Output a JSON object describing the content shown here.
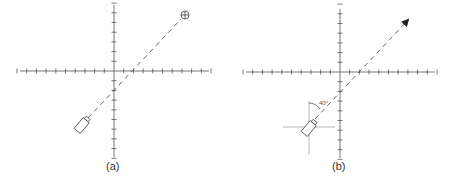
{
  "figure": {
    "panels": [
      {
        "id": "a",
        "caption": "(a)",
        "origin": [
          114,
          71
        ],
        "tick_spacing": 9.7,
        "x_ticks_left": 10,
        "x_ticks_right": 10,
        "y_ticks_up": 7,
        "y_ticks_down": 9,
        "beam": {
          "from": [
            88,
            118
          ],
          "to": [
            181,
            19
          ],
          "style": "dashed"
        },
        "source": {
          "type": "flashlight-icon",
          "center": [
            83,
            124
          ],
          "angle_deg": -50
        },
        "target": {
          "type": "crosshair-target-icon",
          "center": [
            185,
            15
          ]
        }
      },
      {
        "id": "b",
        "caption": "(b)",
        "origin": [
          340,
          72
        ],
        "tick_spacing": 9.7,
        "x_ticks_left": 10,
        "x_ticks_right": 10,
        "y_ticks_up": 7,
        "y_ticks_down": 9,
        "beam": {
          "from": [
            315,
            119
          ],
          "to": [
            408,
            20
          ],
          "style": "dashed-arrow"
        },
        "source": {
          "type": "flashlight-icon",
          "center": [
            310,
            127
          ],
          "angle_deg": -50
        },
        "local_frame": {
          "center": [
            309,
            127
          ],
          "h_half": 26,
          "v_up": 26,
          "v_down": 28
        },
        "angle": {
          "label": "40°",
          "value_deg": 40
        }
      }
    ]
  },
  "colors": {
    "axis": "#555555",
    "beam": "#555555",
    "frame": "#9a9a9a",
    "caption": "#333333"
  }
}
